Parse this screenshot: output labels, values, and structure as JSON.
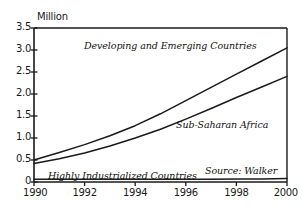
{
  "chart_data": {
    "type": "line",
    "title": "",
    "xlabel": "",
    "ylabel": "Million",
    "xlim": [
      1990,
      2000
    ],
    "ylim": [
      0,
      3.5
    ],
    "grid": false,
    "legend_position": "inline-annotations",
    "x": [
      1990,
      1991,
      1992,
      1993,
      1994,
      1995,
      1996,
      1997,
      1998,
      1999,
      2000
    ],
    "xtick_labels": [
      "1990",
      "1992",
      "1994",
      "1996",
      "1998",
      "2000"
    ],
    "xticks": [
      1990,
      1992,
      1994,
      1996,
      1998,
      2000
    ],
    "ytick_labels": [
      "0",
      "0.5",
      "1.0",
      "1.5",
      "2.0",
      "2.5",
      "3.0",
      "3.5"
    ],
    "yticks": [
      0,
      0.5,
      1.0,
      1.5,
      2.0,
      2.5,
      3.0,
      3.5
    ],
    "series": [
      {
        "name": "Developing and Emerging Countries",
        "values": [
          0.5,
          0.67,
          0.85,
          1.05,
          1.28,
          1.55,
          1.85,
          2.15,
          2.45,
          2.75,
          3.05
        ]
      },
      {
        "name": "Sub-Saharan Africa",
        "values": [
          0.42,
          0.53,
          0.66,
          0.82,
          1.0,
          1.2,
          1.43,
          1.67,
          1.92,
          2.16,
          2.4
        ]
      },
      {
        "name": "Highly Industrialized Countries",
        "values": [
          0.06,
          0.06,
          0.06,
          0.06,
          0.06,
          0.06,
          0.06,
          0.06,
          0.07,
          0.07,
          0.08
        ]
      }
    ],
    "annotations": [
      {
        "text": "Developing and Emerging Countries",
        "x": 1993.4,
        "y": 3.05
      },
      {
        "text": "Sub-Saharan Africa",
        "x": 1997.0,
        "y": 1.45
      },
      {
        "text": "Highly Industrialized Countries",
        "x": 1990.6,
        "y": 0.28
      },
      {
        "text": "Source: Walker",
        "x": 1997.0,
        "y": 0.4
      }
    ],
    "colors": {
      "line": "#1a1a1a",
      "axis": "#1a1a1a",
      "background": "#ffffff",
      "text": "#1a1a1a"
    }
  },
  "labels": {
    "ylabel": "Million",
    "source_note": "Source: Walker",
    "series_developing": "Developing and Emerging Countries",
    "series_subsaharan": "Sub-Saharan Africa",
    "series_industrialized": "Highly Industrialized Countries"
  }
}
